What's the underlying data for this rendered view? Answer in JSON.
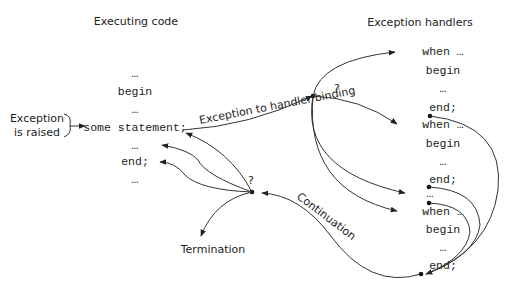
{
  "titles": {
    "left": "Executing code",
    "right": "Exception handlers"
  },
  "code": {
    "ellipsis1": "…",
    "begin": "begin",
    "ellipsis2": "…",
    "statement": "some statement;",
    "ellipsis3": "…",
    "end": "end;",
    "ellipsis4": "…"
  },
  "raised": {
    "line1": "Exception",
    "line2": "is raised"
  },
  "binding_label": "Exception to handler binding",
  "binding_q": "?",
  "continuation_q": "?",
  "continuation_label": "Continuation",
  "termination_label": "Termination",
  "handlers": [
    {
      "when": "when …",
      "begin": "begin",
      "ellipsis": "…",
      "end": "end;"
    },
    {
      "when": "when …",
      "begin": "begin",
      "ellipsis": "…",
      "end": "end;"
    },
    {
      "gap": "…"
    },
    {
      "when": "when …",
      "begin": "begin",
      "ellipsis": "…",
      "end": "end;"
    }
  ]
}
